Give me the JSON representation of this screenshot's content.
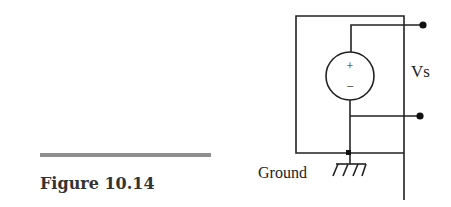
{
  "figure": {
    "caption": "Figure 10.14",
    "rule_color": "#8f8f8f"
  },
  "circuit": {
    "source_label": "Vs",
    "source_polarity_plus": "+",
    "source_polarity_minus": "−",
    "ground_label": "Ground",
    "wire_color": "#222222"
  }
}
